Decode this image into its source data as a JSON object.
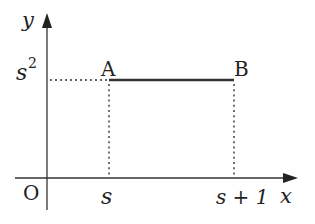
{
  "diagram": {
    "type": "coordinate-plane",
    "axes": {
      "x_label": "x",
      "y_label": "y",
      "origin_label": "O"
    },
    "points": [
      {
        "name": "A",
        "x_expr": "s",
        "y_expr": "s²"
      },
      {
        "name": "B",
        "x_expr": "s + 1",
        "y_expr": "s²"
      }
    ],
    "tick_labels": {
      "x": [
        "s",
        "s + 1"
      ],
      "y": [
        "s²"
      ]
    },
    "labels": {
      "point_a": "A",
      "point_b": "B",
      "x_tick_s": "s",
      "x_tick_s_plus_one": "s + 1",
      "y_tick_base": "s",
      "y_tick_exp": "2"
    },
    "segments": [
      {
        "from": "A",
        "to": "B",
        "style": "solid"
      },
      {
        "from": "y-axis",
        "to": "A",
        "style": "dotted"
      },
      {
        "from": "A",
        "to": "x-axis",
        "style": "dotted"
      },
      {
        "from": "B",
        "to": "x-axis",
        "style": "dotted"
      }
    ],
    "colors": {
      "stroke": "#333333",
      "background": "#ffffff"
    }
  }
}
